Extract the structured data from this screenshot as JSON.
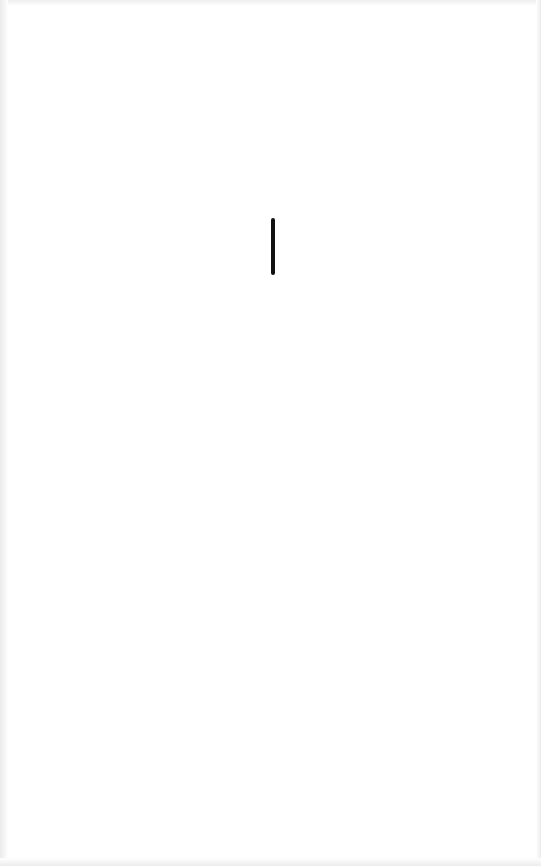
{
  "screen": {
    "state": "blank",
    "background_color": "#ffffff",
    "edge_color": "#ececec"
  },
  "indicator": {
    "type": "vertical-bar",
    "icon": "text-cursor-icon",
    "color": "#111111",
    "x": 271,
    "y": 218,
    "width": 4,
    "height": 57
  }
}
